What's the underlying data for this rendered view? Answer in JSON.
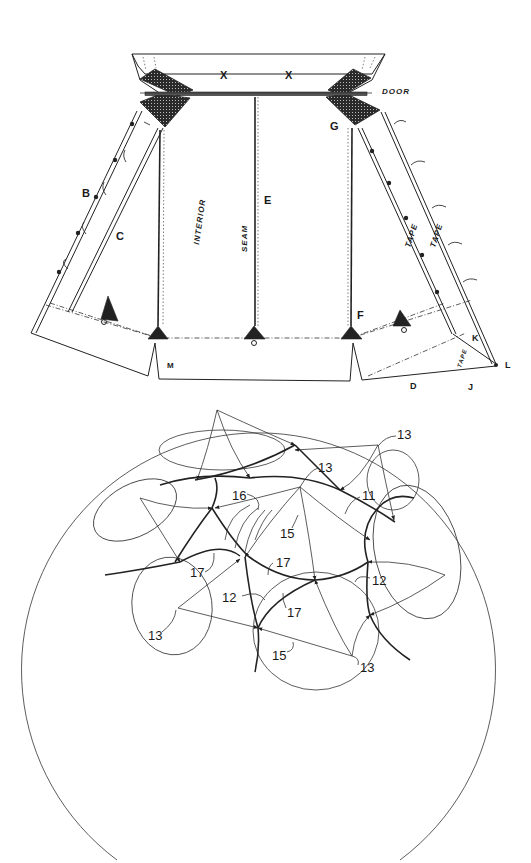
{
  "figure_top": {
    "name": "tent-pattern-layout",
    "labels": {
      "x_left": "X",
      "x_right": "X",
      "door": "DOOR",
      "g": "G",
      "b": "B",
      "c": "C",
      "e": "E",
      "f": "F",
      "m": "M",
      "d": "D",
      "j": "J",
      "k": "K",
      "l": "L",
      "interior": "INTERIOR",
      "seam": "SEAM",
      "tape_1": "TAPE",
      "tape_2": "TAPE",
      "tape_3": "TAPE"
    }
  },
  "figure_bottom": {
    "name": "looped-network-diagram",
    "reference_numerals": {
      "n13_top_right": "13",
      "n13_center": "13",
      "n11": "11",
      "n16": "16",
      "n15_center": "15",
      "n17_left": "17",
      "n17_center": "17",
      "n17_lower": "17",
      "n12_left": "12",
      "n12_right": "12",
      "n13_left": "13",
      "n15_lower": "15",
      "n13_bottom": "13"
    }
  },
  "colors": {
    "background": "#ffffff",
    "ink": "#222222"
  }
}
